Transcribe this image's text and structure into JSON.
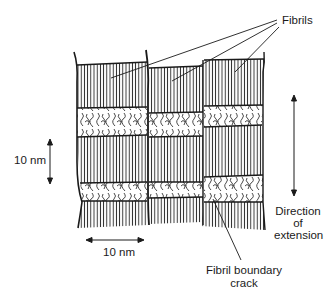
{
  "diagram": {
    "title": "",
    "labels": {
      "fibrils": "Fibrils",
      "vertical_scale": "10 nm",
      "horizontal_scale": "10 nm",
      "direction_line1": "Direction",
      "direction_line2": "of",
      "direction_line3": "extension",
      "crack_line1": "Fibril boundary",
      "crack_line2": "crack"
    },
    "structure": {
      "fibril_columns": 3,
      "layers_per_column": [
        "crystalline lamella",
        "amorphous region",
        "crystalline lamella",
        "amorphous region",
        "crystalline lamella"
      ]
    },
    "colors": {
      "ink": "#1a1a1a",
      "background": "#ffffff"
    }
  }
}
